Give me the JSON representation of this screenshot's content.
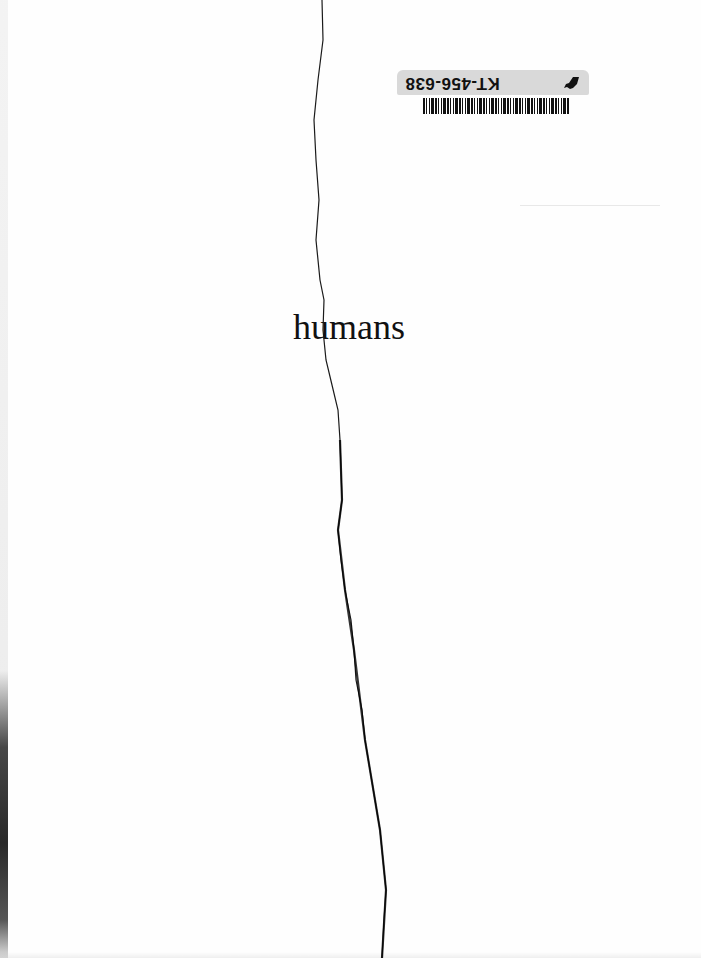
{
  "document": {
    "title_word": "humans",
    "library_sticker": {
      "code": "KT-456-638",
      "orientation": "upside-down",
      "icon": "horse-icon",
      "barcode": "barcode"
    }
  },
  "colors": {
    "paper": "#fefefe",
    "ink": "#111111",
    "sticker_bg": "#d9d9d9"
  }
}
